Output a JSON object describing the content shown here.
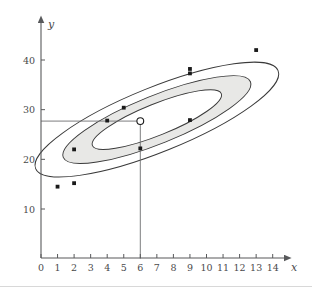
{
  "chart_data": {
    "type": "scatter",
    "title": "",
    "xlabel": "x",
    "ylabel": "y",
    "xlim": [
      0,
      14.8
    ],
    "ylim": [
      5,
      47
    ],
    "grid": false,
    "legend": "none",
    "x_ticks": [
      "0",
      "1",
      "2",
      "3",
      "4",
      "5",
      "6",
      "7",
      "8",
      "9",
      "10",
      "11",
      "12",
      "13",
      "14"
    ],
    "x_tick_values": [
      0,
      1,
      2,
      3,
      4,
      5,
      6,
      7,
      8,
      9,
      10,
      11,
      12,
      13,
      14
    ],
    "y_ticks": [
      "10",
      "20",
      "30",
      "40"
    ],
    "y_tick_values": [
      10,
      20,
      30,
      40
    ],
    "points": [
      {
        "x": 1,
        "y": 14.5,
        "marker": "filled"
      },
      {
        "x": 2,
        "y": 15.2,
        "marker": "filled"
      },
      {
        "x": 2,
        "y": 22.0,
        "marker": "filled"
      },
      {
        "x": 4,
        "y": 27.8,
        "marker": "filled"
      },
      {
        "x": 5,
        "y": 30.4,
        "marker": "filled"
      },
      {
        "x": 6,
        "y": 22.2,
        "marker": "filled"
      },
      {
        "x": 9,
        "y": 27.9,
        "marker": "filled"
      },
      {
        "x": 9,
        "y": 37.3,
        "marker": "filled"
      },
      {
        "x": 9,
        "y": 38.2,
        "marker": "filled"
      },
      {
        "x": 13,
        "y": 42.0,
        "marker": "filled"
      }
    ],
    "highlight_point": {
      "x": 6,
      "y": 27.7,
      "marker": "open"
    },
    "guide_lines": [
      {
        "from": [
          0,
          27.7
        ],
        "to": [
          6,
          27.7
        ],
        "orientation": "horizontal"
      },
      {
        "from": [
          6,
          27.7
        ],
        "to": [
          6,
          0
        ],
        "orientation": "vertical"
      }
    ],
    "ellipses": [
      {
        "name": "outer",
        "cx": 7.0,
        "cy": 28.0,
        "rx": 7.9,
        "ry": 1.95,
        "rotation_deg": -22.0,
        "fill": "none"
      },
      {
        "name": "middle",
        "cx": 7.0,
        "cy": 28.0,
        "rx": 6.1,
        "ry": 1.45,
        "rotation_deg": -22.0,
        "fill": "#e8e8e6"
      },
      {
        "name": "inner",
        "cx": 7.0,
        "cy": 28.0,
        "rx": 4.2,
        "ry": 0.95,
        "rotation_deg": -22.0,
        "fill": "#ffffff"
      }
    ],
    "shaded_band": {
      "description": "region between middle and inner ellipse",
      "color": "#e8e8e6"
    },
    "colors": {
      "axis": "#58595b",
      "ellipse_stroke": "#3a3a3a",
      "band_fill": "#e8e8e6",
      "point_fill": "#1a1a1a",
      "guide": "#6d6e70",
      "background": "#ffffff"
    }
  }
}
